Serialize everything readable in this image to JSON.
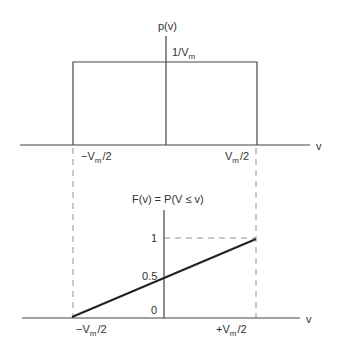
{
  "top_plot": {
    "ylabel": "p(v)",
    "height_label": "1/V",
    "height_label_sub": "m",
    "xlabel": "v",
    "left_tick": "−V",
    "left_tick_sub": "m",
    "left_tick_suffix": "/2",
    "right_tick": "V",
    "right_tick_sub": "m",
    "right_tick_suffix": "/2"
  },
  "bottom_plot": {
    "ylabel": "F(v) = P(V ≤ v)",
    "y_tick_1": "1",
    "y_tick_05": "0.5",
    "y_tick_0": "0",
    "xlabel": "v",
    "left_tick": "−V",
    "left_tick_sub": "m",
    "left_tick_suffix": "/2",
    "right_tick": "+V",
    "right_tick_sub": "m",
    "right_tick_suffix": "/2"
  },
  "colors": {
    "line": "#333333",
    "dashed": "#666666"
  }
}
